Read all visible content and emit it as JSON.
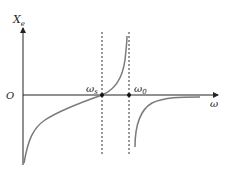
{
  "diagram": {
    "type": "reactance-frequency-curve",
    "axes": {
      "y_label": "X",
      "y_label_sub": "e",
      "x_label": "ω",
      "origin_label": "O"
    },
    "markers": [
      {
        "label": "ω",
        "sub": "s",
        "role": "series-resonance"
      },
      {
        "label": "ω",
        "sub": "0",
        "role": "parallel-resonance"
      }
    ],
    "colors": {
      "axis": "#222222",
      "curve": "#7a7a7a",
      "dashed": "#333333"
    }
  }
}
